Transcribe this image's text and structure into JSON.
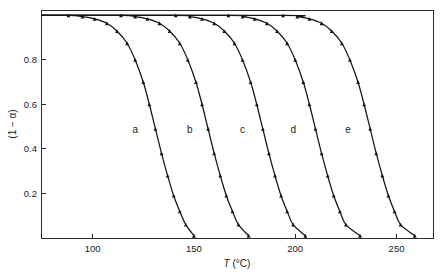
{
  "figure": {
    "background_color": "#ffffff",
    "ink_color": "#141414",
    "axis_color": "#2b2b2b"
  },
  "chart_data": {
    "type": "line",
    "title": "",
    "subtitle": "",
    "xlabel": "T (°C)",
    "xlabel_symbol": "T",
    "xlabel_units": "(°C)",
    "ylabel": "(1 − α)",
    "xlim": [
      75,
      268
    ],
    "ylim": [
      0,
      1.02
    ],
    "xticks": [
      100,
      150,
      200,
      250
    ],
    "xtick_labels": [
      "100",
      "150",
      "200",
      "250"
    ],
    "yticks": [
      0.2,
      0.4,
      0.6,
      0.8
    ],
    "ytick_labels": [
      "0.2",
      "0.4",
      "0.6",
      "0.8"
    ],
    "grid": false,
    "legend": "none",
    "annotations": [
      {
        "text": "a",
        "x": 121,
        "y": 0.47
      },
      {
        "text": "b",
        "x": 148,
        "y": 0.47
      },
      {
        "text": "c",
        "x": 174,
        "y": 0.47
      },
      {
        "text": "d",
        "x": 199,
        "y": 0.47
      },
      {
        "text": "e",
        "x": 226,
        "y": 0.47
      }
    ],
    "series": [
      {
        "name": "a",
        "label": "a",
        "marker": "triangle",
        "x": [
          88,
          95,
          101,
          107,
          112,
          117,
          121,
          125,
          128,
          131,
          134,
          137,
          140,
          143,
          146,
          150
        ],
        "y": [
          1.0,
          0.995,
          0.985,
          0.965,
          0.93,
          0.875,
          0.8,
          0.7,
          0.6,
          0.49,
          0.38,
          0.28,
          0.19,
          0.12,
          0.06,
          0.01
        ]
      },
      {
        "name": "b",
        "label": "b",
        "marker": "triangle",
        "x": [
          114,
          121,
          127,
          133,
          138,
          143,
          147,
          151,
          154,
          157,
          160,
          163,
          166,
          169,
          172,
          177
        ],
        "y": [
          1.0,
          0.995,
          0.985,
          0.965,
          0.93,
          0.875,
          0.8,
          0.7,
          0.6,
          0.49,
          0.38,
          0.28,
          0.19,
          0.12,
          0.06,
          0.01
        ]
      },
      {
        "name": "c",
        "label": "c",
        "marker": "triangle",
        "x": [
          141,
          148,
          154,
          160,
          165,
          170,
          174,
          178,
          181,
          184,
          187,
          190,
          193,
          196,
          199,
          205
        ],
        "y": [
          1.0,
          0.995,
          0.985,
          0.965,
          0.93,
          0.875,
          0.8,
          0.7,
          0.6,
          0.49,
          0.38,
          0.28,
          0.19,
          0.12,
          0.06,
          0.01
        ]
      },
      {
        "name": "d",
        "label": "d",
        "marker": "triangle",
        "x": [
          167,
          174,
          180,
          186,
          191,
          196,
          200,
          204,
          207,
          210,
          213,
          216,
          219,
          222,
          225,
          232
        ],
        "y": [
          1.0,
          0.995,
          0.985,
          0.965,
          0.93,
          0.875,
          0.8,
          0.7,
          0.6,
          0.49,
          0.38,
          0.28,
          0.19,
          0.12,
          0.06,
          0.01
        ]
      },
      {
        "name": "e",
        "label": "e",
        "marker": "triangle",
        "x": [
          194,
          201,
          207,
          213,
          218,
          223,
          227,
          231,
          234,
          237,
          240,
          243,
          246,
          249,
          252,
          259
        ],
        "y": [
          1.0,
          0.995,
          0.985,
          0.965,
          0.93,
          0.875,
          0.8,
          0.7,
          0.6,
          0.49,
          0.38,
          0.28,
          0.19,
          0.12,
          0.06,
          0.01
        ]
      }
    ]
  }
}
